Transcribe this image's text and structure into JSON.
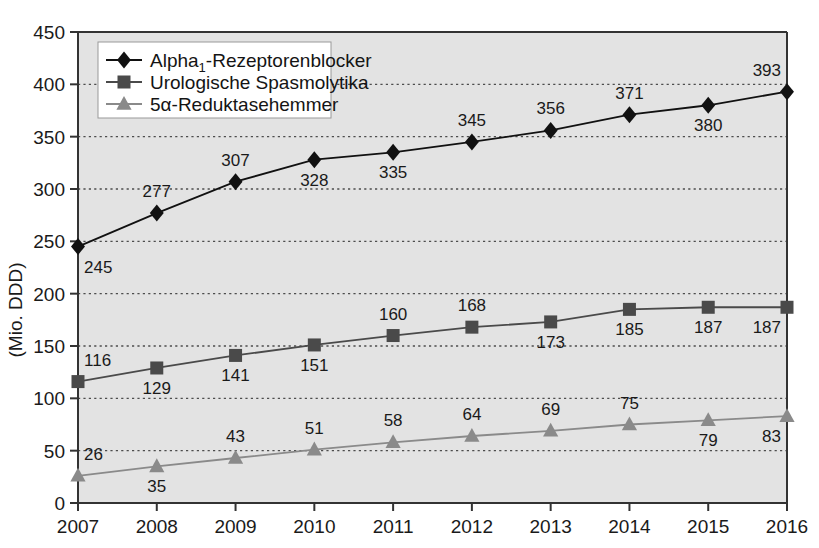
{
  "chart_data": {
    "type": "line",
    "title": "",
    "subtitle": "",
    "xlabel": "",
    "ylabel": "(Mio. DDD)",
    "categories": [
      "2007",
      "2008",
      "2009",
      "2010",
      "2011",
      "2012",
      "2013",
      "2014",
      "2015",
      "2016"
    ],
    "x": [
      2007,
      2008,
      2009,
      2010,
      2011,
      2012,
      2013,
      2014,
      2015,
      2016
    ],
    "ylim": [
      0,
      450
    ],
    "xlim": [
      2007,
      2016
    ],
    "yticks": [
      0,
      50,
      100,
      150,
      200,
      250,
      300,
      350,
      400,
      450
    ],
    "ytick_labels": [
      "0",
      "50",
      "100",
      "150",
      "200",
      "250",
      "300",
      "350",
      "400",
      "450"
    ],
    "grid": true,
    "grid_style": "dotted-horizontal",
    "legend_position": "top-left-inside",
    "plot_background": "#e3e3e3",
    "series": [
      {
        "name": "Alpha₁-Rezeptorenblocker",
        "name_main": "Alpha",
        "name_sub": "1",
        "name_rest": "-Rezeptorenblocker",
        "marker": "diamond",
        "color": "#111111",
        "values": [
          245,
          277,
          307,
          328,
          335,
          345,
          356,
          371,
          380,
          393
        ],
        "label_positions": [
          "below",
          "above",
          "above",
          "below",
          "below",
          "above",
          "above",
          "above",
          "below",
          "above"
        ]
      },
      {
        "name": "Urologische Spasmolytika",
        "marker": "square",
        "color": "#4a4a4a",
        "values": [
          116,
          129,
          141,
          151,
          160,
          168,
          173,
          185,
          187,
          187
        ],
        "label_positions": [
          "above",
          "below",
          "below",
          "below",
          "above",
          "above",
          "below",
          "below",
          "below",
          "below"
        ]
      },
      {
        "name": "5α-Reduktasehemmer",
        "marker": "triangle",
        "color": "#8a8a8a",
        "values": [
          26,
          35,
          43,
          51,
          58,
          64,
          69,
          75,
          79,
          83
        ],
        "label_positions": [
          "above",
          "below",
          "above",
          "above",
          "above",
          "above",
          "above",
          "above",
          "below",
          "below"
        ]
      }
    ]
  },
  "axis": {
    "y_title": "(Mio. DDD)",
    "y_ticks": [
      "450",
      "400",
      "350",
      "300",
      "250",
      "200",
      "150",
      "100",
      "50",
      "0"
    ],
    "x_ticks": [
      "2007",
      "2008",
      "2009",
      "2010",
      "2011",
      "2012",
      "2013",
      "2014",
      "2015",
      "2016"
    ]
  },
  "legend": {
    "items": [
      {
        "label": "Alpha₁-Rezeptorenblocker",
        "marker": "diamond",
        "color": "#111111"
      },
      {
        "label": "Urologische Spasmolytika",
        "marker": "square",
        "color": "#4a4a4a"
      },
      {
        "label": "5α-Reduktasehemmer",
        "marker": "triangle",
        "color": "#8a8a8a"
      }
    ]
  },
  "colors": {
    "series1": "#111111",
    "series2": "#4a4a4a",
    "series3": "#8a8a8a",
    "plot_bg": "#e3e3e3",
    "axis": "#333333",
    "grid": "#4d4d4d",
    "text": "#1a1a1a",
    "legend_bg": "#ffffff"
  }
}
